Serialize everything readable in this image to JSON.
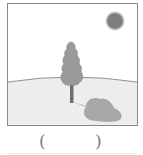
{
  "figure": {
    "elements": [
      "sun",
      "tree",
      "tree-shadow",
      "hill-horizon"
    ],
    "colors": {
      "frame": "#8a8a8a",
      "sky": "#ffffff",
      "ground": "#ededed",
      "sun": "#7d7d7d",
      "tree_crown": "#9a9a9a",
      "trunk": "#6e6e6e",
      "shadow": "#a8a8a8"
    }
  },
  "answer_blank": {
    "left_paren": "(",
    "right_paren": ")"
  }
}
